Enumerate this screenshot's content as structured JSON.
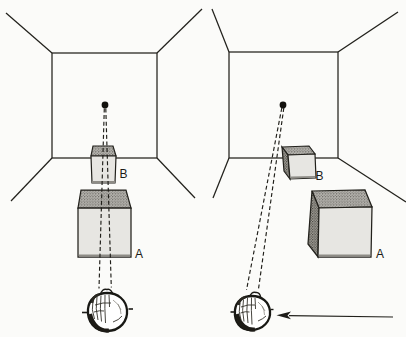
{
  "figure": {
    "title": "",
    "panels": [
      {
        "name": "left-room-view",
        "far_cube_label": "B",
        "near_cube_label": "A"
      },
      {
        "name": "right-room-view",
        "far_cube_label": "B",
        "near_cube_label": "A"
      }
    ],
    "icons": {
      "fixation_dot": "filled-circle",
      "observer_eye": "eyeball-sketch",
      "viewpoint_arrow": "left-pointing-arrow",
      "sight_lines": "dashed-lines"
    },
    "colors": {
      "ink": "#1c1b17",
      "cube_front": "#e7e6e2",
      "cube_top_halftone": "#b7b5b0",
      "cube_side_halftone": "#a3a09a",
      "background": "#fbfbf9"
    }
  }
}
